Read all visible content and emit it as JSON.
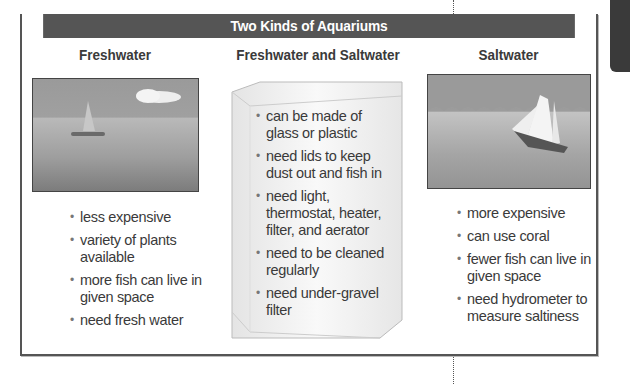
{
  "title": "Two Kinds of Aquariums",
  "columns": [
    {
      "heading": "Freshwater",
      "image": "calm-lake-sailboat-illustration",
      "items": [
        "less expensive",
        "variety of plants available",
        "more fish can live in given space",
        "need fresh water"
      ]
    },
    {
      "heading": "Freshwater and Saltwater",
      "image": "glass-tank-illustration",
      "items": [
        "can be made of glass or plastic",
        "need lids to keep dust out and fish in",
        "need light, thermostat, heater, filter, and aerator",
        "need to be cleaned regularly",
        "need under-gravel filter"
      ]
    },
    {
      "heading": "Saltwater",
      "image": "ocean-waves-schooner-illustration",
      "items": [
        "more expensive",
        "can use coral",
        "fewer fish can live in given space",
        "need hydrometer to measure saltiness"
      ]
    }
  ],
  "colors": {
    "header_bg": "#555555",
    "border": "#555555",
    "text": "#333333"
  }
}
